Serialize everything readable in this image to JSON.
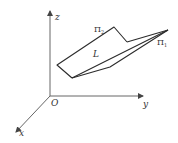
{
  "diagram": {
    "type": "3d-coordinate-planes",
    "axes": {
      "z_label": "z",
      "y_label": "y",
      "x_label": "x",
      "origin_label": "O"
    },
    "planes": [
      {
        "symbol": "Π",
        "subscript": "2",
        "name": "Π2"
      },
      {
        "symbol": "Π",
        "subscript": "1",
        "name": "Π1"
      }
    ],
    "line_label": "L",
    "colors": {
      "stroke": "#2b2b2b",
      "axis": "#555555",
      "text": "#333333",
      "background": "#ffffff"
    }
  }
}
